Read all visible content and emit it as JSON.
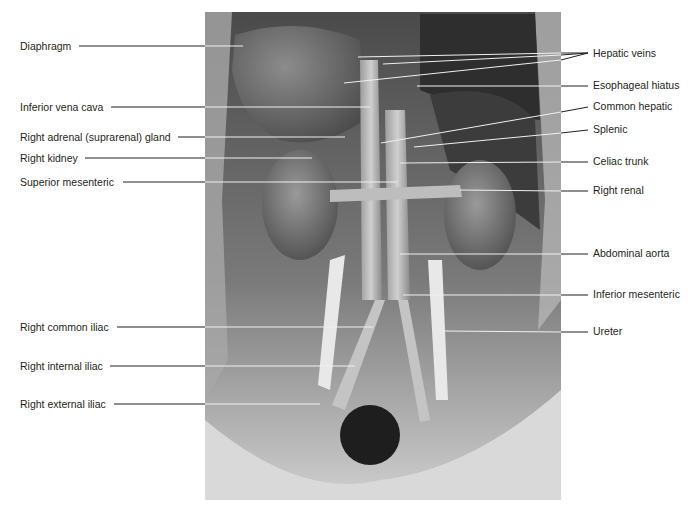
{
  "figure": {
    "photo": {
      "description": "Grayscale dissection photograph of posterior abdominal wall showing kidneys, aorta, inferior vena cava and iliac vessels",
      "colors": {
        "background": "#ffffff",
        "tissue_dark": "#3a3a3a",
        "tissue_mid": "#8a8a8a",
        "tissue_light": "#d6d6d6",
        "leader_line": "#231f20",
        "leader_line_on_photo": "#f2f2f2"
      }
    },
    "labels_left": [
      {
        "text": "Diaphragm",
        "y": 46
      },
      {
        "text": "Inferior vena cava",
        "y": 107
      },
      {
        "text": "Right adrenal (suprarenal) gland",
        "y": 137
      },
      {
        "text": "Right kidney",
        "y": 158
      },
      {
        "text": "Superior mesenteric",
        "y": 182
      },
      {
        "text": "Right common iliac",
        "y": 327
      },
      {
        "text": "Right internal iliac",
        "y": 366
      },
      {
        "text": "Right external iliac",
        "y": 404
      }
    ],
    "labels_right": [
      {
        "text": "Hepatic veins",
        "y": 53
      },
      {
        "text": "Esophageal hiatus",
        "y": 85
      },
      {
        "text": "Common hepatic",
        "y": 106
      },
      {
        "text": "Splenic",
        "y": 129
      },
      {
        "text": "Celiac trunk",
        "y": 161
      },
      {
        "text": "Right renal",
        "y": 190
      },
      {
        "text": "Abdominal aorta",
        "y": 253
      },
      {
        "text": "Inferior mesenteric",
        "y": 294
      },
      {
        "text": "Ureter",
        "y": 331
      }
    ]
  }
}
